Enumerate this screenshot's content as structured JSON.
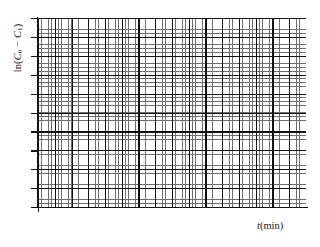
{
  "figure": {
    "kind": "blank-graph-paper-plot",
    "background_color": "#ffffff"
  },
  "chart_data": {
    "type": "line",
    "title": "",
    "subtitle": "",
    "xlabel": "t(min)",
    "ylabel": "ln(C0 − C1)",
    "x": [],
    "values": [],
    "series": [],
    "annotations": [],
    "grid": true,
    "grid_style": "graph-paper",
    "legend": false,
    "legend_position": "none",
    "xlim": [
      0,
      16
    ],
    "ylim": [
      0,
      10
    ],
    "xtick_labels": [],
    "ytick_labels": [],
    "major_divisions_x": 16,
    "major_divisions_y": 10,
    "minor_per_major": 5,
    "note": "Empty plot grid with no plotted data points; axes are unlabeled except for axis titles."
  },
  "axes": {
    "y_axis_label_parts": {
      "prefix": "ln(",
      "var1": "C",
      "sub1": "0",
      "operator": "−",
      "var2": "C",
      "sub2": "1",
      "suffix": ")"
    },
    "x_axis_label_parts": {
      "variable": "t",
      "unit": "(min)"
    },
    "line_color": "#111111",
    "major_grid_color": "#111111",
    "minor_grid_color": "#6f6f6f"
  }
}
